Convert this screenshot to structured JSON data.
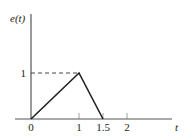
{
  "chart_data": {
    "type": "line",
    "title": "",
    "xlabel": "t",
    "ylabel": "e(t)",
    "xlim": [
      0,
      2.9
    ],
    "ylim": [
      0,
      2.3
    ],
    "grid": false,
    "legend": "none",
    "x_ticks": [
      {
        "value": 0,
        "label": "0"
      },
      {
        "value": 1,
        "label": "1"
      },
      {
        "value": 1.5,
        "label": "1.5"
      },
      {
        "value": 2,
        "label": "2"
      }
    ],
    "y_ticks": [
      {
        "value": 1,
        "label": "1"
      }
    ],
    "series": [
      {
        "name": "e(t)",
        "x": [
          0,
          1,
          1.5
        ],
        "y": [
          0,
          1,
          0
        ]
      }
    ],
    "annotations": [
      {
        "type": "dashed-guide",
        "from": [
          0,
          1
        ],
        "to": [
          1,
          1
        ]
      }
    ]
  }
}
